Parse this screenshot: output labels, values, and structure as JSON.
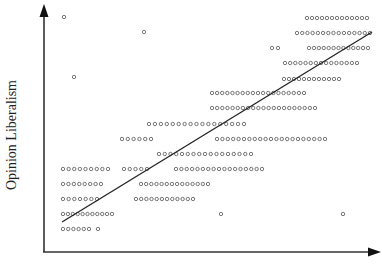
{
  "chart_data": {
    "type": "scatter",
    "title": "",
    "xlabel": "",
    "ylabel": "Opinion Liberalism",
    "grid": false,
    "legend": null,
    "axes": {
      "x_arrow": true,
      "y_arrow": true,
      "ticks": false
    },
    "point_style": {
      "marker": "open-circle",
      "color": "#555555",
      "radius": 1.7
    },
    "regression_line": {
      "x1": 62,
      "y1": 222,
      "x2": 372,
      "y2": 32,
      "color": "#222222"
    },
    "rows": [
      {
        "y": 18,
        "segments": [
          {
            "x_start": 307,
            "x_end": 367,
            "count": 13
          }
        ]
      },
      {
        "y": 33,
        "segments": [
          {
            "x_start": 297,
            "x_end": 370,
            "count": 15
          }
        ]
      },
      {
        "y": 48,
        "segments": [
          {
            "x_start": 272,
            "x_end": 278,
            "count": 2
          },
          {
            "x_start": 309,
            "x_end": 368,
            "count": 13
          }
        ]
      },
      {
        "y": 63,
        "segments": [
          {
            "x_start": 285,
            "x_end": 357,
            "count": 15
          }
        ]
      },
      {
        "y": 79,
        "segments": [
          {
            "x_start": 284,
            "x_end": 339,
            "count": 12
          }
        ]
      },
      {
        "y": 93,
        "segments": [
          {
            "x_start": 212,
            "x_end": 304,
            "count": 19
          }
        ]
      },
      {
        "y": 108,
        "segments": [
          {
            "x_start": 212,
            "x_end": 315,
            "count": 21
          }
        ]
      },
      {
        "y": 124,
        "segments": [
          {
            "x_start": 149,
            "x_end": 244,
            "count": 17
          }
        ]
      },
      {
        "y": 139,
        "segments": [
          {
            "x_start": 122,
            "x_end": 151,
            "count": 6
          },
          {
            "x_start": 217,
            "x_end": 325,
            "count": 21
          }
        ]
      },
      {
        "y": 154,
        "segments": [
          {
            "x_start": 159,
            "x_end": 251,
            "count": 17
          }
        ]
      },
      {
        "y": 169,
        "segments": [
          {
            "x_start": 63,
            "x_end": 108,
            "count": 9
          },
          {
            "x_start": 124,
            "x_end": 147,
            "count": 5
          },
          {
            "x_start": 176,
            "x_end": 262,
            "count": 17
          }
        ]
      },
      {
        "y": 184,
        "segments": [
          {
            "x_start": 63,
            "x_end": 101,
            "count": 8
          },
          {
            "x_start": 141,
            "x_end": 208,
            "count": 14
          }
        ]
      },
      {
        "y": 199,
        "segments": [
          {
            "x_start": 63,
            "x_end": 97,
            "count": 7
          },
          {
            "x_start": 136,
            "x_end": 193,
            "count": 12
          }
        ]
      },
      {
        "y": 214,
        "segments": [
          {
            "x_start": 63,
            "x_end": 112,
            "count": 11
          },
          {
            "x_start": 221,
            "x_end": 221,
            "count": 1
          },
          {
            "x_start": 343,
            "x_end": 343,
            "count": 1
          }
        ]
      },
      {
        "y": 229,
        "segments": [
          {
            "x_start": 63,
            "x_end": 89,
            "count": 6
          },
          {
            "x_start": 98,
            "x_end": 98,
            "count": 1
          }
        ]
      }
    ],
    "outliers": [
      {
        "x": 64,
        "y": 17
      },
      {
        "x": 144,
        "y": 32
      },
      {
        "x": 74,
        "y": 77
      }
    ]
  }
}
